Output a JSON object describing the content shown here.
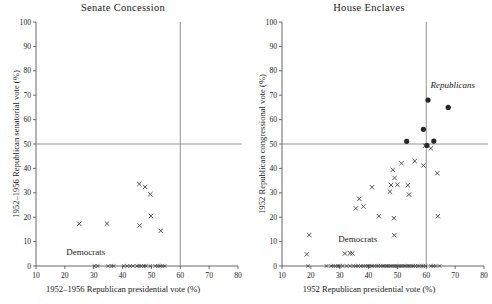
{
  "figure": {
    "width": 492,
    "height": 304,
    "background": "#ffffff",
    "marker_colors": {
      "cross": "#3a3a3a",
      "dot": "#262626",
      "axis": "#4d4d4d",
      "reference_line": "#808080"
    }
  },
  "chart_data": [
    {
      "type": "scatter",
      "panel": "left",
      "title": "Senate Concession",
      "xlabel": "1952–1956 Republican presidential vote (%)",
      "ylabel": "1952–1956 Republican senatorial vote (%)",
      "xlim": [
        10,
        80
      ],
      "ylim": [
        0,
        100
      ],
      "xticks": [
        10,
        20,
        30,
        40,
        50,
        60,
        70,
        80
      ],
      "yticks": [
        0,
        10,
        20,
        30,
        40,
        50,
        60,
        70,
        80,
        90,
        100
      ],
      "grid": false,
      "legend": "none",
      "reference_lines": [
        {
          "axis": "y",
          "value": 50
        },
        {
          "axis": "x",
          "value": 60
        }
      ],
      "annotations": [
        {
          "text": "Democrats",
          "x": 20.5,
          "y": 4.5,
          "style": "roman"
        }
      ],
      "series": [
        {
          "name": "Democrats",
          "marker": "x",
          "points": [
            {
              "x": 25.0,
              "y": 17.3
            },
            {
              "x": 34.6,
              "y": 17.4
            },
            {
              "x": 45.8,
              "y": 33.6
            },
            {
              "x": 47.8,
              "y": 32.4
            },
            {
              "x": 49.6,
              "y": 29.4
            },
            {
              "x": 49.8,
              "y": 20.5
            },
            {
              "x": 45.9,
              "y": 16.6
            },
            {
              "x": 53.2,
              "y": 14.4
            }
          ]
        }
      ],
      "rug_x": [
        30.2,
        31.4,
        35.0,
        36.2,
        36.9,
        40.4,
        41.6,
        42.6,
        43.6,
        45.0,
        45.8,
        46.5,
        47.4,
        48.1,
        49.6,
        51.4,
        52.2,
        53.0,
        53.8,
        54.6
      ]
    },
    {
      "type": "scatter",
      "panel": "right",
      "title": "House Enclaves",
      "xlabel": "1952 Republican presidential vote (%)",
      "ylabel": "1952 Republican congressional vote (%)",
      "xlim": [
        10,
        80
      ],
      "ylim": [
        0,
        100
      ],
      "xticks": [
        10,
        20,
        30,
        40,
        50,
        60,
        70,
        80
      ],
      "yticks": [
        0,
        10,
        20,
        30,
        40,
        50,
        60,
        70,
        80,
        90,
        100
      ],
      "grid": false,
      "legend": "none",
      "reference_lines": [
        {
          "axis": "y",
          "value": 50
        },
        {
          "axis": "x",
          "value": 60
        }
      ],
      "annotations": [
        {
          "text": "Republicans",
          "x": 61.5,
          "y": 73.0,
          "style": "italic"
        },
        {
          "text": "Democrats",
          "x": 29.5,
          "y": 9.8,
          "style": "roman"
        }
      ],
      "series": [
        {
          "name": "Republicans",
          "marker": "dot",
          "points": [
            {
              "x": 60.6,
              "y": 68.0
            },
            {
              "x": 67.6,
              "y": 65.0
            },
            {
              "x": 59.0,
              "y": 56.0
            },
            {
              "x": 53.2,
              "y": 51.1
            },
            {
              "x": 62.6,
              "y": 51.2
            },
            {
              "x": 60.2,
              "y": 49.4
            }
          ]
        },
        {
          "name": "Democrats",
          "marker": "x",
          "points": [
            {
              "x": 18.6,
              "y": 4.8
            },
            {
              "x": 19.4,
              "y": 12.7
            },
            {
              "x": 31.8,
              "y": 5.1
            },
            {
              "x": 33.6,
              "y": 5.2
            },
            {
              "x": 34.4,
              "y": 5.2
            },
            {
              "x": 35.6,
              "y": 23.6
            },
            {
              "x": 36.8,
              "y": 27.5
            },
            {
              "x": 38.2,
              "y": 24.4
            },
            {
              "x": 41.2,
              "y": 32.3
            },
            {
              "x": 43.6,
              "y": 20.4
            },
            {
              "x": 47.4,
              "y": 30.5
            },
            {
              "x": 47.8,
              "y": 33.2
            },
            {
              "x": 48.4,
              "y": 39.4
            },
            {
              "x": 48.8,
              "y": 19.6
            },
            {
              "x": 48.9,
              "y": 12.6
            },
            {
              "x": 49.0,
              "y": 36.1
            },
            {
              "x": 50.0,
              "y": 33.3
            },
            {
              "x": 51.4,
              "y": 42.1
            },
            {
              "x": 53.6,
              "y": 33.1
            },
            {
              "x": 54.0,
              "y": 29.3
            },
            {
              "x": 56.0,
              "y": 43.0
            },
            {
              "x": 59.0,
              "y": 41.2
            },
            {
              "x": 59.6,
              "y": 49.3
            },
            {
              "x": 61.6,
              "y": 48.2
            },
            {
              "x": 63.8,
              "y": 38.0
            },
            {
              "x": 64.0,
              "y": 20.4
            }
          ]
        }
      ],
      "rug_x": [
        19.0,
        25.4,
        27.0,
        27.8,
        28.6,
        29.4,
        30.0,
        31.0,
        32.4,
        33.6,
        34.8,
        35.6,
        36.4,
        37.4,
        38.2,
        39.0,
        39.8,
        40.4,
        41.2,
        42.0,
        42.8,
        43.4,
        44.2,
        45.0,
        45.6,
        46.4,
        47.0,
        47.8,
        48.4,
        49.2,
        49.8,
        50.6,
        51.2,
        52.0,
        52.6,
        53.4,
        54.0,
        54.8,
        55.4,
        56.2,
        57.0,
        57.6,
        58.4,
        59.0,
        59.8,
        61.6,
        62.4,
        63.2,
        64.6
      ]
    }
  ]
}
